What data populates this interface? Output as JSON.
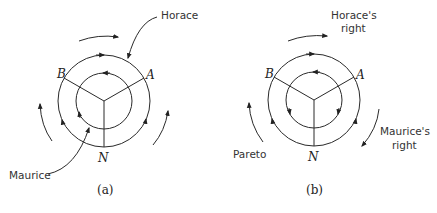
{
  "figure": {
    "panels": [
      {
        "id": "a",
        "sublabel": "(a)",
        "vertices": {
          "B": "B",
          "A": "A",
          "N": "N"
        },
        "annotations": {
          "top": "Horace",
          "bottom_left": "Maurice"
        }
      },
      {
        "id": "b",
        "sublabel": "(b)",
        "vertices": {
          "B": "B",
          "A": "A",
          "N": "N"
        },
        "annotations": {
          "top_line1": "Horace's",
          "top_line2": "right",
          "right_line1": "Maurice's",
          "right_line2": "right",
          "left": "Pareto"
        }
      }
    ]
  }
}
